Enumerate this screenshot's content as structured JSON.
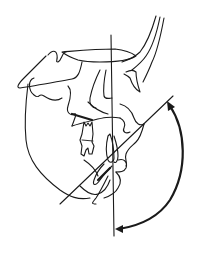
{
  "figure": {
    "type": "cephalometric-tracing",
    "stroke_color": "#1a1a1a",
    "background": "#ffffff",
    "elements": {
      "vertical_reference_line": {
        "x1": 111,
        "y1": 35,
        "x2": 114,
        "y2": 236
      },
      "oblique_line": {
        "x1": 60,
        "y1": 204,
        "x2": 173,
        "y2": 96
      },
      "angle_arc": {
        "start": [
          169,
          104
        ],
        "end": [
          117,
          229
        ],
        "arrowheads": "both"
      }
    },
    "labels": []
  }
}
